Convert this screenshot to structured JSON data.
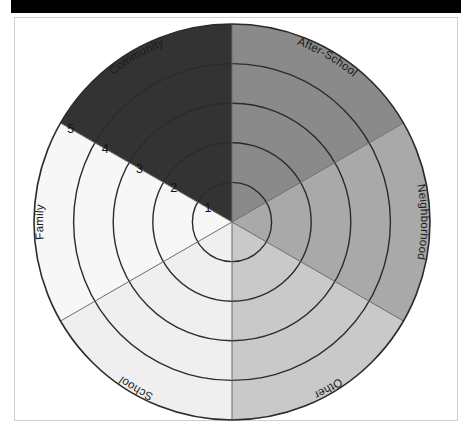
{
  "figure": {
    "title": "",
    "top_bar_color": "#000000",
    "frame_border_color": "#cfcfcf",
    "background_color": "#ffffff",
    "outline_color": "#2b2b2b",
    "divider_color": "#6b6b6b"
  },
  "chart_data": {
    "type": "pie",
    "variant": "concentric-ring-sector-target",
    "title": "",
    "xlabel": "",
    "ylabel": "",
    "center": {
      "x": 232,
      "y": 222
    },
    "outer_radius": 198,
    "ring_count": 5,
    "ring_radii": [
      39.6,
      79.2,
      118.8,
      158.4,
      198
    ],
    "ring_labels": [
      "1",
      "2",
      "3",
      "4",
      "5"
    ],
    "ring_label_angle_deg": 210,
    "sector_count": 6,
    "categories": [
      "Community",
      "After-School",
      "Neighborhood",
      "Other",
      "School",
      "Family"
    ],
    "values": [
      60,
      60,
      60,
      60,
      60,
      60
    ],
    "legend_position": "around-perimeter",
    "grid": true,
    "sectors": [
      {
        "label": "Community",
        "start_angle_deg": 210,
        "end_angle_deg": 270,
        "color": "#333333",
        "label_angle_deg": 240,
        "label_flip": false
      },
      {
        "label": "After-School",
        "start_angle_deg": 270,
        "end_angle_deg": 330,
        "color": "#8a8a8a",
        "label_angle_deg": 300,
        "label_flip": false
      },
      {
        "label": "Neighborhood",
        "start_angle_deg": 330,
        "end_angle_deg": 30,
        "color": "#a9a9a9",
        "label_angle_deg": 0,
        "label_flip": false
      },
      {
        "label": "Other",
        "start_angle_deg": 30,
        "end_angle_deg": 90,
        "color": "#c9c9c9",
        "label_angle_deg": 60,
        "label_flip": false
      },
      {
        "label": "School",
        "start_angle_deg": 90,
        "end_angle_deg": 150,
        "color": "#efefef",
        "label_angle_deg": 120,
        "label_flip": false
      },
      {
        "label": "Family",
        "start_angle_deg": 150,
        "end_angle_deg": 210,
        "color": "#f7f7f7",
        "label_angle_deg": 180,
        "label_flip": false
      }
    ]
  }
}
